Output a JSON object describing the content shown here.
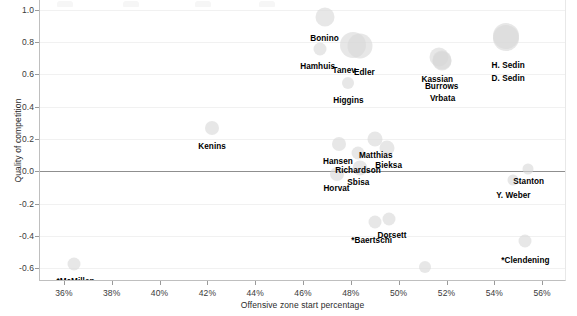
{
  "chart_data": {
    "type": "scatter",
    "title": "",
    "xlabel": "Offensive zone start percentage",
    "ylabel": "Quality of competition",
    "xlim": [
      35.0,
      57.0
    ],
    "ylim": [
      -0.68,
      1.06
    ],
    "xticks": [
      "36%",
      "38%",
      "40%",
      "42%",
      "44%",
      "46%",
      "48%",
      "50%",
      "52%",
      "54%",
      "56%"
    ],
    "xtick_values": [
      36,
      38,
      40,
      42,
      44,
      46,
      48,
      50,
      52,
      54,
      56
    ],
    "yticks": [
      "1.0",
      "0.8",
      "0.6",
      "0.4",
      "0.2",
      "0.0",
      "-0.2",
      "-0.4",
      "-0.6"
    ],
    "ytick_values": [
      1.0,
      0.8,
      0.6,
      0.4,
      0.2,
      0.0,
      -0.2,
      -0.4,
      -0.6
    ],
    "grid": true,
    "zero_line": true,
    "legend": "none",
    "bubble_color": "#d9d9d9",
    "points": [
      {
        "label": "Bonino",
        "x": 46.9,
        "y": 0.955,
        "size": 19,
        "label_dx": 0,
        "label_dy": 21
      },
      {
        "label": "Hamhuis",
        "x": 46.7,
        "y": 0.755,
        "size": 13,
        "label_dx": -2,
        "label_dy": 17
      },
      {
        "label": "Tanev",
        "x": 48.1,
        "y": 0.78,
        "size": 26,
        "label_dx": -9,
        "label_dy": 25
      },
      {
        "label": "Edler",
        "x": 48.4,
        "y": 0.775,
        "size": 25,
        "label_dx": 4,
        "label_dy": 26
      },
      {
        "label": "Higgins",
        "x": 47.9,
        "y": 0.545,
        "size": 12,
        "label_dx": 0,
        "label_dy": 17
      },
      {
        "label": "Kassian",
        "x": 51.7,
        "y": 0.705,
        "size": 19,
        "label_dx": -2,
        "label_dy": 22
      },
      {
        "label": "Burrows",
        "x": 51.8,
        "y": 0.685,
        "size": 19,
        "label_dx": 0,
        "label_dy": 25
      },
      {
        "label": "Vrbata",
        "x": 51.8,
        "y": 0.69,
        "size": 19,
        "label_dx": 1,
        "label_dy": 38
      },
      {
        "label": "H. Sedin",
        "x": 54.5,
        "y": 0.835,
        "size": 26,
        "label_dx": 2,
        "label_dy": 29
      },
      {
        "label": "D. Sedin",
        "x": 54.5,
        "y": 0.825,
        "size": 26,
        "label_dx": 2,
        "label_dy": 40
      },
      {
        "label": "Kenins",
        "x": 42.2,
        "y": 0.265,
        "size": 14,
        "label_dx": 0,
        "label_dy": 18
      },
      {
        "label": "Matthias",
        "x": 49.0,
        "y": 0.2,
        "size": 15,
        "label_dx": 1,
        "label_dy": 16
      },
      {
        "label": "Hansen",
        "x": 47.5,
        "y": 0.17,
        "size": 14,
        "label_dx": -1,
        "label_dy": 17
      },
      {
        "label": "Bieksa",
        "x": 49.5,
        "y": 0.145,
        "size": 15,
        "label_dx": 2,
        "label_dy": 17
      },
      {
        "label": "Richardson",
        "x": 48.3,
        "y": 0.11,
        "size": 13,
        "label_dx": 0,
        "label_dy": 17
      },
      {
        "label": "Sbisa",
        "x": 48.4,
        "y": 0.02,
        "size": 15,
        "label_dx": -2,
        "label_dy": 14
      },
      {
        "label": "Horvat",
        "x": 47.4,
        "y": -0.02,
        "size": 14,
        "label_dx": 0,
        "label_dy": 14
      },
      {
        "label": "Stanton",
        "x": 55.4,
        "y": 0.015,
        "size": 11,
        "label_dx": 1,
        "label_dy": 12
      },
      {
        "label": "Y. Weber",
        "x": 54.8,
        "y": -0.055,
        "size": 11,
        "label_dx": 0,
        "label_dy": 15
      },
      {
        "label": "*Baertschi",
        "x": 49.0,
        "y": -0.315,
        "size": 13,
        "label_dx": -3,
        "label_dy": 18
      },
      {
        "label": "Dorsett",
        "x": 49.6,
        "y": -0.295,
        "size": 13,
        "label_dx": 3,
        "label_dy": 16
      },
      {
        "label": "*Clendening",
        "x": 55.3,
        "y": -0.43,
        "size": 13,
        "label_dx": 0,
        "label_dy": 19
      },
      {
        "label": "Vey",
        "x": 51.1,
        "y": -0.59,
        "size": 12,
        "label_dx": 0,
        "label_dy": 17
      },
      {
        "label": "*McMillan",
        "x": 36.4,
        "y": -0.575,
        "size": 13,
        "label_dx": 2,
        "label_dy": 17
      }
    ]
  }
}
